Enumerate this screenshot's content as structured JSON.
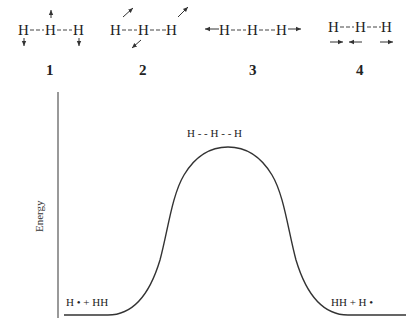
{
  "structures": [
    {
      "id": "1",
      "label": "1",
      "atoms": [
        "H",
        "H",
        "H"
      ],
      "description": "symmetric bend: middle H up, outer H down"
    },
    {
      "id": "2",
      "label": "2",
      "atoms": [
        "H",
        "H",
        "H"
      ],
      "description": "asymmetric diagonal motions"
    },
    {
      "id": "3",
      "label": "3",
      "atoms": [
        "H",
        "H",
        "H"
      ],
      "description": "symmetric stretch: outer atoms outward"
    },
    {
      "id": "4",
      "label": "4",
      "atoms": [
        "H",
        "H",
        "H"
      ],
      "description": "asymmetric stretch"
    }
  ],
  "diagram": {
    "ylabel": "Energy",
    "transition_state": {
      "atoms": [
        "H",
        "H",
        "H"
      ],
      "text": "H - - H - - H"
    },
    "reactants": "H • + HH",
    "products": "HH + H •"
  }
}
